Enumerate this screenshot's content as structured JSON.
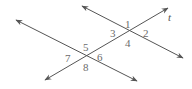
{
  "diagram": {
    "type": "parallel-lines-transversal",
    "colors": {
      "line": "#555555",
      "label": "#6b6b6b"
    },
    "transversal": {
      "label": "t"
    },
    "lines": [
      {
        "name": "upper-line"
      },
      {
        "name": "lower-line"
      }
    ],
    "angles": {
      "a1": "1",
      "a2": "2",
      "a3": "3",
      "a4": "4",
      "a5": "5",
      "a6": "6",
      "a7": "7",
      "a8": "8"
    }
  }
}
